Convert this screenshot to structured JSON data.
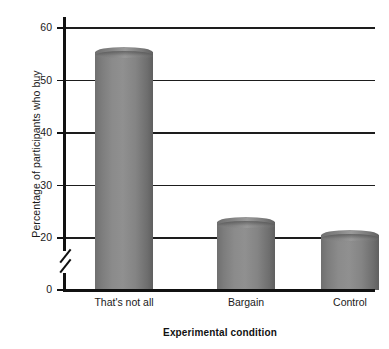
{
  "chart_data": {
    "type": "bar",
    "title": "",
    "subtitle": "",
    "xlabel": "Experimental condition",
    "ylabel": "Percentage of participants who buy",
    "categories": [
      "That's not all",
      "Bargain",
      "Control"
    ],
    "values": [
      55.5,
      23.0,
      20.5
    ],
    "series": [
      {
        "name": "Percentage of participants who buy",
        "values": [
          55.5,
          23.0,
          20.5
        ]
      }
    ],
    "ylim": [
      0,
      60
    ],
    "y_ticks": [
      0,
      20,
      30,
      40,
      50,
      60
    ],
    "y_tick_labels": [
      "0",
      "20",
      "30",
      "40",
      "50",
      "60"
    ],
    "axis_break": {
      "present": true,
      "between": [
        0,
        20
      ],
      "description": "broken y-axis between 0 and 20"
    },
    "grid": "horizontal",
    "legend": "none",
    "bar_color": "#8a8a8a",
    "axis_color": "#111111",
    "background_color": "#ffffff",
    "annotations": []
  },
  "axes": {
    "y_title": "Percentage of participants who buy",
    "x_title": "Experimental condition",
    "ticks": [
      {
        "label": "60",
        "value": 60
      },
      {
        "label": "50",
        "value": 50
      },
      {
        "label": "40",
        "value": 40
      },
      {
        "label": "30",
        "value": 30
      },
      {
        "label": "20",
        "value": 20
      },
      {
        "label": "0",
        "value": 0
      }
    ]
  },
  "bars": [
    {
      "label": "That's not all",
      "value": 55.5
    },
    {
      "label": "Bargain",
      "value": 23.0
    },
    {
      "label": "Control",
      "value": 20.5
    }
  ]
}
